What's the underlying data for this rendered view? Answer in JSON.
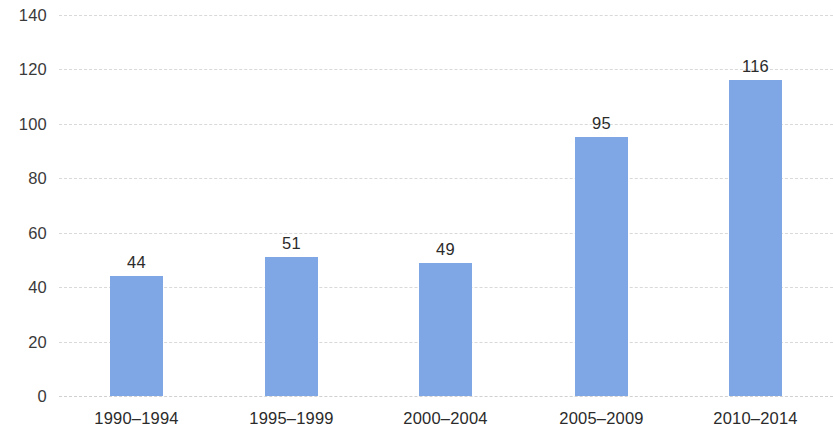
{
  "chart_data": {
    "type": "bar",
    "title": "",
    "subtitle": "",
    "xlabel": "",
    "ylabel": "",
    "categories": [
      "1990–1994",
      "1995–1999",
      "2000–2004",
      "2005–2009",
      "2010–2014"
    ],
    "values": [
      44,
      51,
      49,
      95,
      116
    ],
    "data_labels": [
      "44",
      "51",
      "49",
      "95",
      "116"
    ],
    "ylim": [
      0,
      140
    ],
    "ytick_values": [
      0,
      20,
      40,
      60,
      80,
      100,
      120,
      140
    ],
    "ytick_labels": [
      "0",
      "20",
      "40",
      "60",
      "80",
      "100",
      "120",
      "140"
    ],
    "grid": {
      "horizontal": true,
      "vertical": false,
      "style": "dashed",
      "color": "#d9d9d9"
    },
    "legend": {
      "visible": false,
      "position": "none",
      "entries": []
    },
    "colors": {
      "bar": "#7fa6e5",
      "text": "#2b2b2b",
      "tick_text": "#3a3a3a",
      "gridline": "#d9d9d9",
      "background": "#ffffff"
    },
    "annotations": []
  }
}
